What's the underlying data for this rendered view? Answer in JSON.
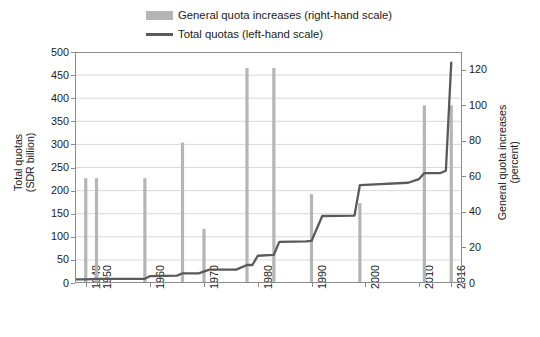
{
  "legend": {
    "items": [
      {
        "label": "General quota increases (right-hand scale)",
        "marker": "bar-swatch",
        "color": "#b5b5b5"
      },
      {
        "label": "Total quotas (left-hand scale)",
        "marker": "line-swatch",
        "color": "#5a5a5a"
      }
    ]
  },
  "axes": {
    "left_title_line1": "Total quotas",
    "left_title_line2": "(SDR billion)",
    "right_title_line1": "General quota increases",
    "right_title_line2": "(percent)",
    "left_ticks": [
      "500",
      "450",
      "400",
      "350",
      "300",
      "250",
      "200",
      "150",
      "100",
      "50",
      "0"
    ],
    "right_ticks": [
      "120",
      "100",
      "80",
      "60",
      "40",
      "20",
      "0"
    ],
    "x_ticks": [
      "1948",
      "1950",
      "1960",
      "1970",
      "1980",
      "1990",
      "2000",
      "2010",
      "2016"
    ]
  },
  "chart_data": {
    "type": "bar",
    "title": "",
    "subtitle": "",
    "xlabel": "",
    "ylabel": "Total quotas (SDR billion)",
    "y2label": "General quota increases (percent)",
    "ylim": [
      0,
      500
    ],
    "y2lim": [
      0,
      130
    ],
    "xlim": [
      1946,
      2018
    ],
    "grid": "horizontal",
    "legend_position": "top",
    "x_tick_values": [
      1948,
      1950,
      1960,
      1970,
      1980,
      1990,
      2000,
      2010,
      2016
    ],
    "series": [
      {
        "name": "General quota increases (right-hand scale)",
        "type": "bar",
        "axis": "right",
        "unit": "percent",
        "color": "#b5b5b5",
        "points": [
          {
            "x": 1948,
            "y": 59
          },
          {
            "x": 1950,
            "y": 59
          },
          {
            "x": 1959,
            "y": 59
          },
          {
            "x": 1966,
            "y": 79
          },
          {
            "x": 1970,
            "y": 30.5
          },
          {
            "x": 1978,
            "y": 121
          },
          {
            "x": 1983,
            "y": 121
          },
          {
            "x": 1990,
            "y": 50
          },
          {
            "x": 1999,
            "y": 45
          },
          {
            "x": 2011,
            "y": 100
          },
          {
            "x": 2016,
            "y": 100
          }
        ]
      },
      {
        "name": "Total quotas (left-hand scale)",
        "type": "line",
        "axis": "left",
        "unit": "SDR billion",
        "color": "#5a5a5a",
        "points": [
          {
            "x": 1946,
            "y": 8
          },
          {
            "x": 1948,
            "y": 8
          },
          {
            "x": 1950,
            "y": 9
          },
          {
            "x": 1955,
            "y": 9
          },
          {
            "x": 1959,
            "y": 9
          },
          {
            "x": 1960,
            "y": 15
          },
          {
            "x": 1965,
            "y": 16
          },
          {
            "x": 1966,
            "y": 21
          },
          {
            "x": 1969,
            "y": 21
          },
          {
            "x": 1971,
            "y": 29
          },
          {
            "x": 1976,
            "y": 29
          },
          {
            "x": 1978,
            "y": 39
          },
          {
            "x": 1979,
            "y": 39
          },
          {
            "x": 1980,
            "y": 59
          },
          {
            "x": 1983,
            "y": 61
          },
          {
            "x": 1984,
            "y": 89
          },
          {
            "x": 1989,
            "y": 90
          },
          {
            "x": 1990,
            "y": 91
          },
          {
            "x": 1992,
            "y": 145
          },
          {
            "x": 1998,
            "y": 146
          },
          {
            "x": 1999,
            "y": 212
          },
          {
            "x": 2008,
            "y": 217
          },
          {
            "x": 2010,
            "y": 225
          },
          {
            "x": 2011,
            "y": 238
          },
          {
            "x": 2014,
            "y": 238
          },
          {
            "x": 2015,
            "y": 243
          },
          {
            "x": 2016,
            "y": 477
          }
        ]
      }
    ]
  }
}
